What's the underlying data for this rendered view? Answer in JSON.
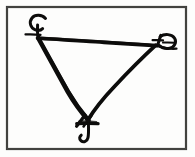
{
  "figure": {
    "title": "Inverted triangle sigil with calligraphic vertex flourishes",
    "medium": "pen and ink line drawing",
    "background_color": "#fdfdfc",
    "ink_color": "#0d0c0b",
    "frame_color": "#3a3a38"
  },
  "frame": {
    "name": "rectangular border",
    "x": 6,
    "y": 6,
    "width": 181,
    "height": 144,
    "stroke_width": 2,
    "color": "#3a3a38"
  },
  "shape": {
    "name": "inverted triangle",
    "orientation": "point-down",
    "stroke_color": "#0d0c0b",
    "vertices": [
      {
        "label": "top-left",
        "x": 39,
        "y": 39
      },
      {
        "label": "top-right",
        "x": 155,
        "y": 46
      },
      {
        "label": "bottom",
        "x": 88,
        "y": 119
      }
    ],
    "edges": [
      {
        "label": "top edge",
        "from": "top-left",
        "to": "top-right",
        "stroke_width": 4
      },
      {
        "label": "left edge",
        "from": "top-left",
        "to": "bottom",
        "stroke_width": 5
      },
      {
        "label": "right edge",
        "from": "top-right",
        "to": "bottom",
        "stroke_width": 4
      }
    ]
  },
  "flourishes": [
    {
      "id": "flourish-top-left",
      "at_vertex": "top-left",
      "form": "open leftward curl with descending stem and crossing tick",
      "glyph_hint": "C-loop",
      "center_x": 39,
      "center_y": 28
    },
    {
      "id": "flourish-top-right",
      "at_vertex": "top-right",
      "form": "reversed loop hook with crossing tick",
      "glyph_hint": "reversed-e",
      "center_x": 161,
      "center_y": 44
    },
    {
      "id": "flourish-bottom",
      "at_vertex": "bottom",
      "form": "crossed strokes with horizontal bar and descending J hook",
      "glyph_hint": "J-hook",
      "center_x": 88,
      "center_y": 128
    }
  ],
  "caption": {
    "alt_text": "Inverted triangle sigil with calligraphic vertex flourishes"
  }
}
